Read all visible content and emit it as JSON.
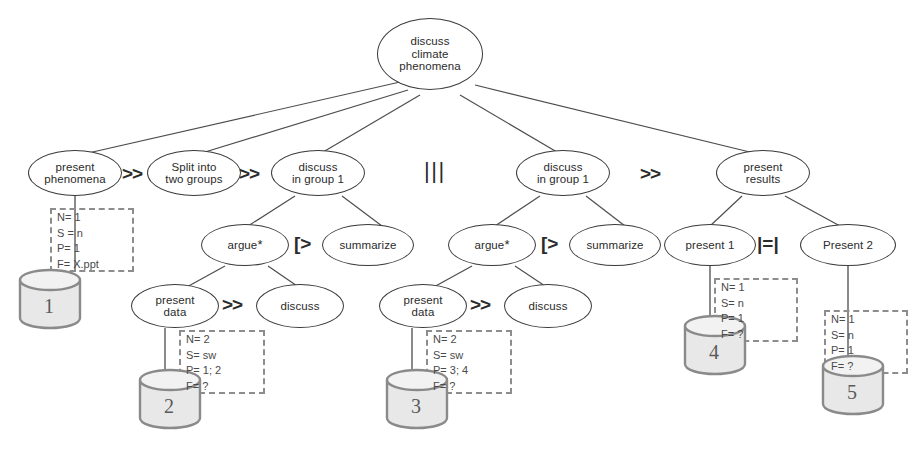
{
  "diagram": {
    "root": {
      "label": "discuss\nclimate\nphenomena"
    },
    "nodes": [
      {
        "id": "present-phenomena",
        "label": "present\nphenomena"
      },
      {
        "id": "split-groups",
        "label": "Split into\ntwo groups"
      },
      {
        "id": "discuss-group-1a",
        "label": "discuss\nin group 1"
      },
      {
        "id": "discuss-group-1b",
        "label": "discuss\nin group 1"
      },
      {
        "id": "present-results",
        "label": "present\nresults"
      },
      {
        "id": "argue-left",
        "label": "argue",
        "star": "*"
      },
      {
        "id": "summarize-left",
        "label": "summarize"
      },
      {
        "id": "argue-right",
        "label": "argue",
        "star": "*"
      },
      {
        "id": "summarize-right",
        "label": "summarize"
      },
      {
        "id": "present-1",
        "label": "present 1"
      },
      {
        "id": "present-2",
        "label": "Present 2"
      },
      {
        "id": "present-data-left",
        "label": "present\ndata"
      },
      {
        "id": "discuss-left",
        "label": "discuss"
      },
      {
        "id": "present-data-right",
        "label": "present\ndata"
      },
      {
        "id": "discuss-right",
        "label": "discuss"
      }
    ],
    "operators": [
      {
        "id": "op-1",
        "symbol": ">>"
      },
      {
        "id": "op-2",
        "symbol": ">>"
      },
      {
        "id": "op-3",
        "symbol": "|||"
      },
      {
        "id": "op-4",
        "symbol": ">>"
      },
      {
        "id": "op-5",
        "symbol": "[>"
      },
      {
        "id": "op-6",
        "symbol": "[>"
      },
      {
        "id": "op-7",
        "symbol": "|=|"
      },
      {
        "id": "op-8",
        "symbol": ">>"
      },
      {
        "id": "op-9",
        "symbol": ">>"
      }
    ],
    "annotations": [
      {
        "id": "ann-1",
        "lines": [
          "N= 1",
          "S = n",
          "P= 1",
          "F= X.ppt"
        ]
      },
      {
        "id": "ann-2",
        "lines": [
          "N= 2",
          "S= sw",
          "P= 1; 2",
          "F= ?"
        ]
      },
      {
        "id": "ann-3",
        "lines": [
          "N= 2",
          "S= sw",
          "P= 3; 4",
          "F= ?"
        ]
      },
      {
        "id": "ann-4",
        "lines": [
          "N= 1",
          "S= n",
          "P= 1",
          "F= ?"
        ]
      },
      {
        "id": "ann-5",
        "lines": [
          "N= 1",
          "S= n",
          "P= 1",
          "F= ?"
        ]
      }
    ],
    "databases": [
      {
        "id": "db-1",
        "label": "1"
      },
      {
        "id": "db-2",
        "label": "2"
      },
      {
        "id": "db-3",
        "label": "3"
      },
      {
        "id": "db-4",
        "label": "4"
      },
      {
        "id": "db-5",
        "label": "5"
      }
    ],
    "colors": {
      "node_stroke": "#3a3a3a",
      "edge_stroke": "#4d4d4d",
      "dashed_stroke": "#8d8d8d",
      "db_stroke": "#8a8a8a",
      "db_fill": "#e8e8e8",
      "text": "#2b2b2b",
      "background": "#ffffff"
    }
  }
}
